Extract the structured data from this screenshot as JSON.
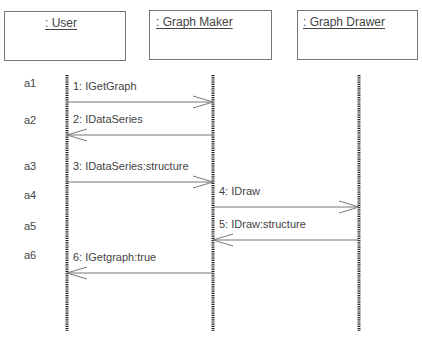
{
  "objects": [
    {
      "id": "user",
      "label": ": User"
    },
    {
      "id": "maker",
      "label": ": Graph Maker"
    },
    {
      "id": "drawer",
      "label": ": Graph Drawer"
    }
  ],
  "messages": [
    {
      "step": "a1",
      "label": "1: IGetGraph",
      "from": "user",
      "to": "maker"
    },
    {
      "step": "a2",
      "label": "2: IDataSeries",
      "from": "maker",
      "to": "user"
    },
    {
      "step": "a3",
      "label": "3: IDataSeries:structure",
      "from": "user",
      "to": "maker"
    },
    {
      "step": "a4",
      "label": "4: IDraw",
      "from": "maker",
      "to": "drawer"
    },
    {
      "step": "a5",
      "label": "5: IDraw:structure",
      "from": "drawer",
      "to": "maker"
    },
    {
      "step": "a6",
      "label": "6: IGetgraph:true",
      "from": "maker",
      "to": "user"
    }
  ],
  "colors": {
    "line": "#777777",
    "lifeline": "#222222",
    "text": "#444444"
  }
}
